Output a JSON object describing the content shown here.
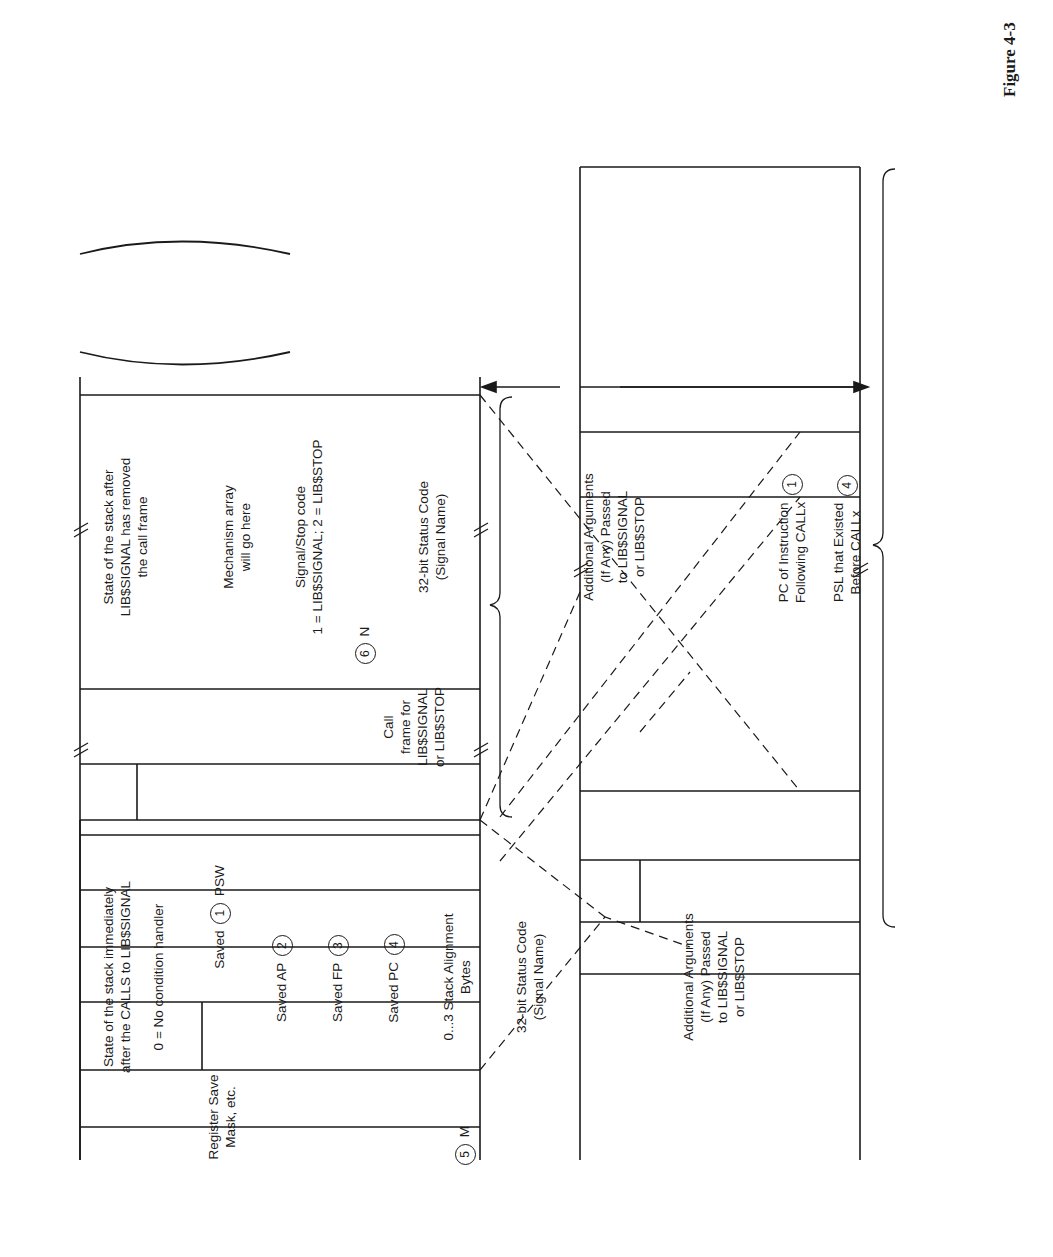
{
  "figure_label": "Figure 4-3",
  "left_stack": {
    "heading": [
      "State of the stack immediately",
      "after the CALLS to LIB$SIGNAL"
    ],
    "cells": {
      "condition_handler": "0 = No condition handler",
      "register_save_mask": [
        "Register Save",
        "Mask, etc."
      ],
      "saved_psw_prefix": "Saved",
      "saved_psw_num": "1",
      "saved_psw_suffix": "PSW",
      "saved_ap": "Saved AP",
      "saved_ap_num": "2",
      "saved_fp": "Saved FP",
      "saved_fp_num": "3",
      "saved_pc": "Saved PC",
      "saved_pc_num": "4",
      "alignment": [
        "0...3 Stack Alignment",
        "Bytes"
      ],
      "arg_count_num": "5",
      "arg_count_label": "M",
      "status_code": [
        "32-bit Status Code",
        "(Signal Name)"
      ],
      "additional_args": [
        "Additional Arguments",
        "(If Any) Passed",
        "to LIB$SIGNAL",
        "or LIB$STOP"
      ]
    }
  },
  "right_stack": {
    "heading": [
      "State of the stack after",
      "LIB$SIGNAL has removed",
      "the call frame"
    ],
    "cells": {
      "mechanism": [
        "Mechanism array",
        "will go here"
      ],
      "signal_stop": [
        "Signal/Stop code",
        "1 = LIB$SIGNAL; 2 = LIB$STOP"
      ],
      "arg_count_num": "6",
      "arg_count_label": "N",
      "status_code": [
        "32-bit Status Code",
        "(Signal Name)"
      ],
      "additional_args": [
        "Additional Arguments",
        "(If Any) Passed",
        "to LIB$SIGNAL",
        "or LIB$STOP"
      ],
      "pc_following": [
        "PC of Instruction",
        "Following CALLx"
      ],
      "pc_following_num": "1",
      "psl_existed": [
        "PSL that Existed",
        "Before CALLx"
      ],
      "psl_existed_num": "4"
    }
  },
  "annotations": {
    "call_frame": [
      "Call",
      "frame for",
      "LIB$SIGNAL",
      "or LIB$STOP"
    ],
    "discard_heading": [
      "The call frame is discarded before",
      "handlers are called."
    ],
    "notes": [
      {
        "num": "1",
        "text": [
          "Saved PSW = low 16",
          "bits of PSL in signal",
          "array"
        ]
      },
      {
        "num": "2",
        "text": [
          "Saved AP→AP"
        ]
      },
      {
        "num": "3",
        "text": [
          "Saved FP→FP"
        ]
      },
      {
        "num": "4",
        "text": [
          "Saved PC→signal array"
        ]
      },
      {
        "num": "5",
        "text": [
          "M is the size of the",
          "argument list."
        ]
      },
      {
        "num": "6",
        "text": [
          "N is the size of the",
          "signal array (N = M+2)."
        ]
      }
    ],
    "exit_note": [
      "Exit from LIB$SIGNAL with",
      "REI and not RET."
    ],
    "shift_note": [
      "The argument list is",
      "shifted up 8 bytes",
      "to make room for the",
      "PC/PSL pair so",
      "that hardware and",
      "software signal arrays",
      "look the same."
    ],
    "pc_moved_banner": "The PC following the CALLx is moved from the frame to the signal array.",
    "argument_list_brace": [
      "Argument list",
      "passed to",
      "LIB$SIGNAL or",
      "LIB$STOP"
    ],
    "signal_array_brace": [
      "Signal",
      "array",
      "passed to",
      "condition",
      "handlers"
    ],
    "sp_value": [
      "Value of SP before",
      "call and push",
      "of argument list"
    ],
    "callg_note": [
      "If CALLG instead of",
      "CALLS, then the argument list is",
      "copied from elsewhere to the",
      "signal array. The rest of the",
      "call frame is discarded",
      "in the same fashion."
    ]
  }
}
